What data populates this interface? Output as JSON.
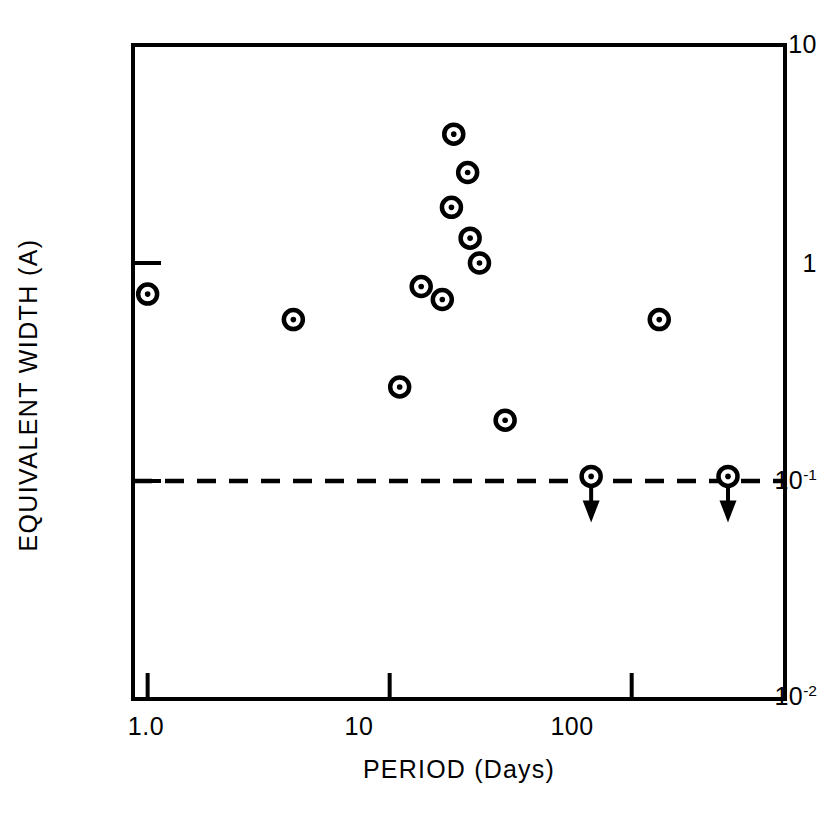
{
  "chart_data": {
    "type": "scatter",
    "title": "",
    "xlabel": "PERIOD (Days)",
    "ylabel": "EQUIVALENT WIDTH (A)",
    "xscale": "log",
    "yscale": "log",
    "xlim": [
      0.87,
      430
    ],
    "ylim": [
      0.01,
      10
    ],
    "grid": false,
    "legend": null,
    "xticks": [
      {
        "value": 1.0,
        "label": "1.0"
      },
      {
        "value": 10,
        "label": "10"
      },
      {
        "value": 100,
        "label": "100"
      }
    ],
    "yticks": [
      {
        "value": 10,
        "label": "10",
        "sup": ""
      },
      {
        "value": 1,
        "label": "1",
        "sup": ""
      },
      {
        "value": 0.1,
        "label": "10",
        "sup": "-1"
      },
      {
        "value": 0.01,
        "label": "10",
        "sup": "-2"
      }
    ],
    "marker": "circle-with-center-dot",
    "points": [
      {
        "x": 1.0,
        "y": 0.72,
        "limit": false
      },
      {
        "x": 4.0,
        "y": 0.55,
        "limit": false
      },
      {
        "x": 11.0,
        "y": 0.27,
        "limit": false
      },
      {
        "x": 13.5,
        "y": 0.78,
        "limit": false
      },
      {
        "x": 16.5,
        "y": 0.68,
        "limit": false
      },
      {
        "x": 18.0,
        "y": 1.8,
        "limit": false
      },
      {
        "x": 18.4,
        "y": 3.9,
        "limit": false
      },
      {
        "x": 21.0,
        "y": 2.6,
        "limit": false
      },
      {
        "x": 21.5,
        "y": 1.3,
        "limit": false
      },
      {
        "x": 23.5,
        "y": 1.0,
        "limit": false
      },
      {
        "x": 30.0,
        "y": 0.19,
        "limit": false
      },
      {
        "x": 130.0,
        "y": 0.55,
        "limit": false
      },
      {
        "x": 68.0,
        "y": 0.105,
        "limit": true
      },
      {
        "x": 250.0,
        "y": 0.105,
        "limit": true
      }
    ],
    "reference_line": {
      "type": "horizontal-dashed",
      "y": 0.1,
      "style": "dashed"
    },
    "annotations": [
      {
        "kind": "upper-limit-arrow",
        "x": 68.0,
        "y": 0.105
      },
      {
        "kind": "upper-limit-arrow",
        "x": 250.0,
        "y": 0.105
      }
    ]
  },
  "figure": {
    "background": "#ffffff",
    "ink": "#000000",
    "frame": {
      "left_px": 133,
      "right_px": 785,
      "top_px": 45,
      "bottom_px": 699
    }
  }
}
